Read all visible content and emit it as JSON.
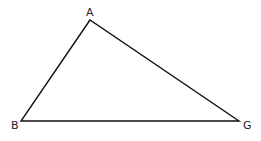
{
  "diagram": {
    "type": "triangle",
    "stroke_color": "#111111",
    "vertices": [
      {
        "id": "A",
        "label": "A",
        "x": 90,
        "y": 20
      },
      {
        "id": "B",
        "label": "B",
        "x": 21,
        "y": 121
      },
      {
        "id": "G",
        "label": "G",
        "x": 239,
        "y": 121
      }
    ],
    "edges": [
      [
        "A",
        "B"
      ],
      [
        "B",
        "G"
      ],
      [
        "G",
        "A"
      ]
    ]
  }
}
